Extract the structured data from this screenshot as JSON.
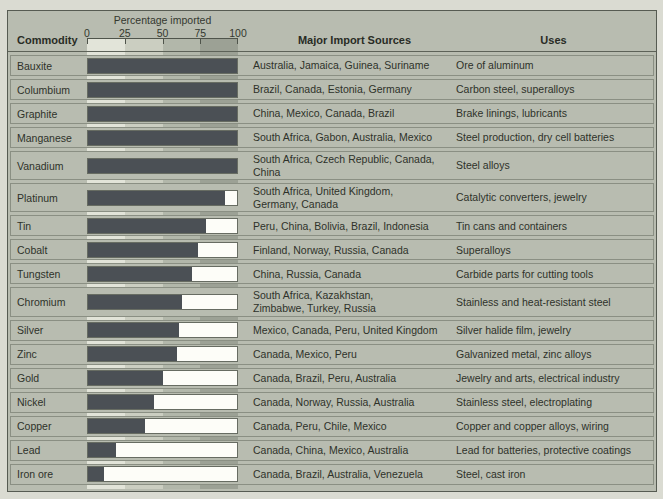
{
  "columns": {
    "commodity": "Commodity",
    "sources": "Major Import Sources",
    "uses": "Uses"
  },
  "colors": {
    "page_bg": "#dadbd2",
    "table_bg": "#b8bcb0",
    "bar_fill": "#4b5055",
    "bar_track": "#fdfdf8",
    "scale_bands": [
      "#e2e4d9",
      "#cbcec1",
      "#b2b7aa",
      "#9ca195"
    ]
  },
  "chart_data": {
    "type": "bar",
    "title": "Percentage imported",
    "xlabel": "Percentage imported",
    "ylabel": "Commodity",
    "xlim": [
      0,
      100
    ],
    "x_ticks": [
      0,
      25,
      50,
      75,
      100
    ],
    "grid": "quartile background bands",
    "legend": "none",
    "categories": [
      "Bauxite",
      "Columbium",
      "Graphite",
      "Manganese",
      "Vanadium",
      "Platinum",
      "Tin",
      "Cobalt",
      "Tungsten",
      "Chromium",
      "Silver",
      "Zinc",
      "Gold",
      "Nickel",
      "Copper",
      "Lead",
      "Iron ore"
    ],
    "values": [
      100,
      100,
      100,
      100,
      100,
      92,
      79,
      74,
      70,
      63,
      61,
      60,
      50,
      44,
      38,
      19,
      11
    ],
    "rows": [
      {
        "commodity": "Bauxite",
        "percent_imported": 100,
        "sources": "Australia, Jamaica, Guinea, Suriname",
        "uses": "Ore of aluminum"
      },
      {
        "commodity": "Columbium",
        "percent_imported": 100,
        "sources": "Brazil, Canada, Estonia, Germany",
        "uses": "Carbon steel, superalloys"
      },
      {
        "commodity": "Graphite",
        "percent_imported": 100,
        "sources": "China, Mexico, Canada, Brazil",
        "uses": "Brake linings, lubricants"
      },
      {
        "commodity": "Manganese",
        "percent_imported": 100,
        "sources": "South Africa, Gabon, Australia, Mexico",
        "uses": "Steel production, dry cell batteries"
      },
      {
        "commodity": "Vanadium",
        "percent_imported": 100,
        "sources": "South Africa, Czech Republic, Canada,\nChina",
        "uses": "Steel alloys"
      },
      {
        "commodity": "Platinum",
        "percent_imported": 92,
        "sources": "South Africa, United Kingdom,\nGermany, Canada",
        "uses": "Catalytic converters, jewelry"
      },
      {
        "commodity": "Tin",
        "percent_imported": 79,
        "sources": "Peru, China, Bolivia, Brazil, Indonesia",
        "uses": "Tin cans and containers"
      },
      {
        "commodity": "Cobalt",
        "percent_imported": 74,
        "sources": "Finland, Norway, Russia, Canada",
        "uses": "Superalloys"
      },
      {
        "commodity": "Tungsten",
        "percent_imported": 70,
        "sources": "China, Russia, Canada",
        "uses": "Carbide parts for cutting tools"
      },
      {
        "commodity": "Chromium",
        "percent_imported": 63,
        "sources": "South Africa, Kazakhstan,\nZimbabwe, Turkey, Russia",
        "uses": "Stainless and heat-resistant steel"
      },
      {
        "commodity": "Silver",
        "percent_imported": 61,
        "sources": "Mexico, Canada, Peru, United Kingdom",
        "uses": "Silver halide film, jewelry"
      },
      {
        "commodity": "Zinc",
        "percent_imported": 60,
        "sources": "Canada, Mexico, Peru",
        "uses": "Galvanized metal, zinc alloys"
      },
      {
        "commodity": "Gold",
        "percent_imported": 50,
        "sources": "Canada, Brazil, Peru, Australia",
        "uses": "Jewelry and arts, electrical industry"
      },
      {
        "commodity": "Nickel",
        "percent_imported": 44,
        "sources": "Canada, Norway, Russia, Australia",
        "uses": "Stainless steel, electroplating"
      },
      {
        "commodity": "Copper",
        "percent_imported": 38,
        "sources": "Canada, Peru, Chile, Mexico",
        "uses": "Copper and copper alloys, wiring"
      },
      {
        "commodity": "Lead",
        "percent_imported": 19,
        "sources": "Canada, China, Mexico, Australia",
        "uses": "Lead for batteries, protective coatings"
      },
      {
        "commodity": "Iron ore",
        "percent_imported": 11,
        "sources": "Canada, Brazil, Australia, Venezuela",
        "uses": "Steel, cast iron"
      }
    ]
  }
}
